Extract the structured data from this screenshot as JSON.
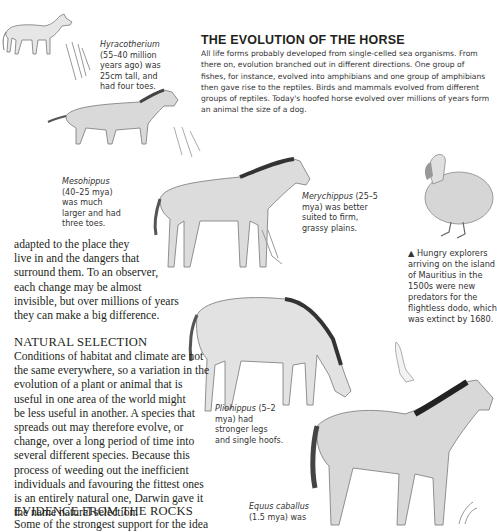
{
  "article": {
    "title": "THE EVOLUTION OF THE HORSE",
    "intro": "All life forms probably developed from single-celled sea organisms. From there on, evolution branched out in different directions. One group of fishes, for instance, evolved into amphibians and one group of amphibians then gave rise to the reptiles. Birds and mammals evolved from different groups of reptiles. Today's hoofed horse evolved over millions of years form an animal the size of a dog."
  },
  "captions": {
    "hyracotherium": {
      "name": "Hyracotherium",
      "text": " (55–40 million years ago) was 25cm tall, and had four toes."
    },
    "mesohippus": {
      "name": "Mesohippus",
      "text": " (40–25 mya) was much larger and had three toes."
    },
    "merychippus": {
      "name": "Merychippus",
      "text": " (25–5 mya) was better suited to firm, grassy plains."
    },
    "dodo": {
      "marker": "▲",
      "text": " Hungry explorers arriving on the island of Mauritius in the 1500s were new predators for the flightless dodo, which was extinct by 1680."
    },
    "pliohippus": {
      "name": "Pliohippus",
      "text": " (5–2 mya) had stronger legs and single hoofs."
    },
    "equus": {
      "name": "Equus caballus",
      "text": " (1.5 mya) was"
    }
  },
  "body": {
    "para1_lines": [
      "adapted to the place they",
      "live in and the dangers that",
      "surround them. To an observer,",
      "each change may be almost",
      "invisible, but over millions of years",
      "they can make a big difference."
    ],
    "natural_selection": {
      "heading": "NATURAL SELECTION",
      "lines": [
        "Conditions of habitat and climate are not",
        "the same everywhere, so a variation in the",
        "evolution of a plant or animal that is",
        "useful in one area of the world might",
        "be less useful in another. A species that",
        "spreads out may therefore evolve, or",
        "change, over a long period of time into",
        "several different species. Because this",
        "process of weeding out the inefficient",
        "individuals and favouring the fittest ones",
        "is an entirely natural one, Darwin gave it",
        "the name natural selection."
      ]
    },
    "evidence": {
      "heading": "EVIDENCE FROM THE ROCKS",
      "partial_line": "Some of the strongest support for the idea"
    }
  },
  "illustrations": [
    {
      "name": "hyracotherium-illustration"
    },
    {
      "name": "mesohippus-illustration"
    },
    {
      "name": "merychippus-illustration"
    },
    {
      "name": "dodo-illustration"
    },
    {
      "name": "pliohippus-illustration"
    },
    {
      "name": "equus-illustration"
    }
  ]
}
